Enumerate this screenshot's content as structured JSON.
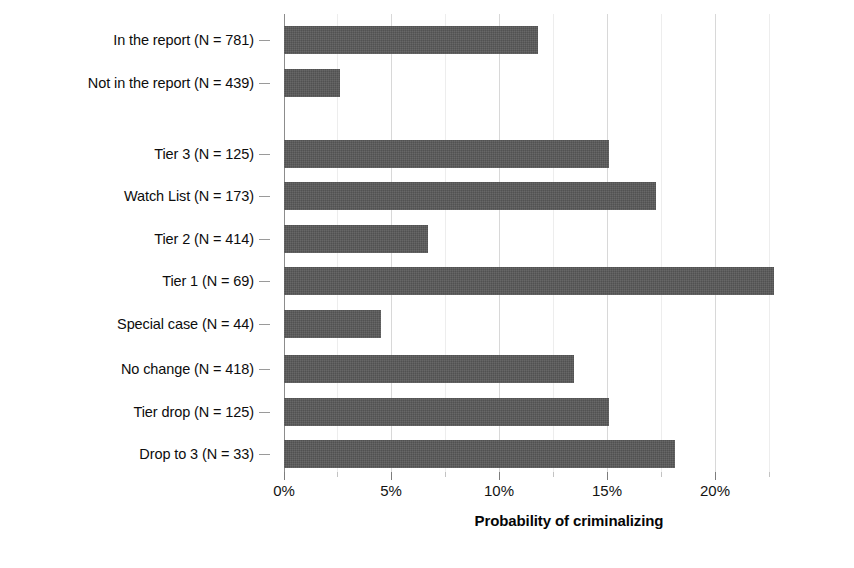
{
  "chart_data": {
    "type": "bar",
    "orientation": "horizontal",
    "title": "",
    "xlabel": "Probability of criminalizing",
    "ylabel": "",
    "xlim": [
      0,
      24.5
    ],
    "xticks": [
      0,
      5,
      10,
      15,
      20
    ],
    "xticklabels": [
      "0%",
      "5%",
      "10%",
      "15%",
      "20%"
    ],
    "minor_xticks": [
      2.5,
      7.5,
      12.5,
      17.5,
      22.5
    ],
    "grid": "vertical",
    "legend": "none",
    "bar_color": "#585858",
    "groups": [
      {
        "name": "report-inclusion",
        "categories": [
          "In the report (N = 781)",
          "Not in the report (N = 439)"
        ],
        "values": [
          11.8,
          2.6
        ]
      },
      {
        "name": "tier-status",
        "categories": [
          "Tier 3 (N = 125)",
          "Watch List (N = 173)",
          "Tier 2 (N = 414)",
          "Tier 1 (N = 69)",
          "Special case (N = 44)"
        ],
        "values": [
          15.1,
          17.3,
          6.7,
          22.8,
          4.5
        ]
      },
      {
        "name": "tier-change",
        "categories": [
          "No change (N = 418)",
          "Tier drop (N = 125)",
          "Drop to 3 (N = 33)"
        ],
        "values": [
          13.5,
          15.1,
          18.2
        ]
      }
    ]
  },
  "axis": {
    "x_title": "Probability of criminalizing",
    "tick_labels": [
      "0%",
      "5%",
      "10%",
      "15%",
      "20%"
    ]
  },
  "bars": [
    {
      "label": "In the report (N = 781)",
      "value": 11.8,
      "n": 781
    },
    {
      "label": "Not in the report (N = 439)",
      "value": 2.6,
      "n": 439
    },
    {
      "label": "Tier 3 (N = 125)",
      "value": 15.1,
      "n": 125
    },
    {
      "label": "Watch List (N = 173)",
      "value": 17.3,
      "n": 173
    },
    {
      "label": "Tier 2 (N = 414)",
      "value": 6.7,
      "n": 414
    },
    {
      "label": "Tier 1 (N = 69)",
      "value": 22.8,
      "n": 69
    },
    {
      "label": "Special case (N = 44)",
      "value": 4.5,
      "n": 44
    },
    {
      "label": "No change (N = 418)",
      "value": 13.5,
      "n": 418
    },
    {
      "label": "Tier drop (N = 125)",
      "value": 15.1,
      "n": 125
    },
    {
      "label": "Drop to 3 (N = 33)",
      "value": 18.2,
      "n": 33
    }
  ],
  "layout": {
    "rows_y": [
      26,
      69,
      140,
      182,
      225,
      252,
      291,
      355,
      398,
      440
    ],
    "bar_height": 28,
    "px_per_unit": 21.5,
    "plot_left": 284
  }
}
